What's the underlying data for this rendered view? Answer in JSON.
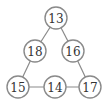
{
  "diagram": {
    "type": "number-triangle",
    "nodes": [
      {
        "id": "top",
        "label": "13",
        "cx": 56,
        "cy": 18
      },
      {
        "id": "mid-left",
        "label": "18",
        "cx": 35,
        "cy": 51
      },
      {
        "id": "mid-right",
        "label": "16",
        "cx": 73,
        "cy": 51
      },
      {
        "id": "bottom-left",
        "label": "15",
        "cx": 18,
        "cy": 87
      },
      {
        "id": "bottom-middle",
        "label": "14",
        "cx": 55,
        "cy": 87
      },
      {
        "id": "bottom-right",
        "label": "17",
        "cx": 90,
        "cy": 87
      }
    ],
    "edges": [
      [
        "top",
        "mid-left"
      ],
      [
        "top",
        "mid-right"
      ],
      [
        "mid-left",
        "bottom-left"
      ],
      [
        "mid-right",
        "bottom-right"
      ],
      [
        "bottom-left",
        "bottom-middle"
      ],
      [
        "bottom-middle",
        "bottom-right"
      ]
    ],
    "colors": {
      "stroke": "#8a8a8a",
      "text": "#333333",
      "background": "#ffffff"
    }
  }
}
